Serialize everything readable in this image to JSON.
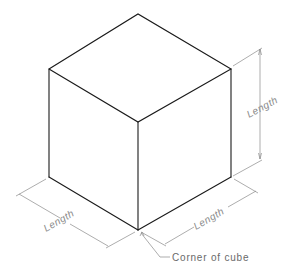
{
  "diagram": {
    "type": "isometric-cube-dimensioned",
    "labels": {
      "height_dim": "Length",
      "left_dim": "Length",
      "right_dim": "Length",
      "corner_note": "Corner of cube"
    },
    "colors": {
      "edges": "#1a1a1a",
      "dimension_lines": "#8a8a8a",
      "background": "#ffffff"
    }
  }
}
